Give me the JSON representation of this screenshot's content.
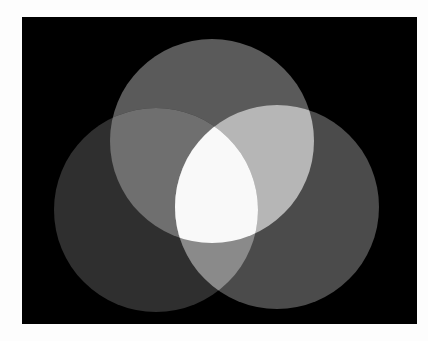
{
  "image": {
    "description": "Three overlapping gray circles on a black background (additive light / Venn style)",
    "background": "#fdfdfd",
    "frame": {
      "x": 22,
      "y": 17,
      "width": 395,
      "height": 307,
      "color": "#000000"
    },
    "circles": [
      {
        "name": "top",
        "cx": 212,
        "cy": 141,
        "r": 102,
        "color": "#5a5a5a"
      },
      {
        "name": "left",
        "cx": 156,
        "cy": 210,
        "r": 102,
        "color": "#2f2f2f"
      },
      {
        "name": "right",
        "cx": 277,
        "cy": 207,
        "r": 102,
        "color": "#4b4b4b"
      }
    ],
    "overlaps": {
      "top_left": "#6f6f6f",
      "top_right": "#b6b6b6",
      "left_right": "#8a8a8a",
      "all_three": "#f9f9f9"
    }
  }
}
